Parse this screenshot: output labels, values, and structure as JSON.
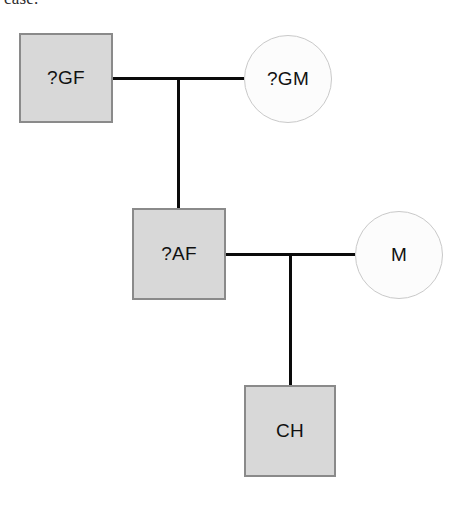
{
  "page": {
    "width": 467,
    "height": 506,
    "background": "#ffffff",
    "clipped_caption": "case."
  },
  "colors": {
    "male_fill": "#d8d8d8",
    "male_stroke": "#8a8a8a",
    "female_fill": "#fcfcfc",
    "female_stroke": "#c9c9c9",
    "line": "#0a0a0a",
    "text": "#111111"
  },
  "diagram": {
    "type": "pedigree-chart",
    "title": "",
    "generations": 3,
    "nodes": [
      {
        "id": "GF",
        "label": "?GF",
        "shape": "square",
        "sex": "male",
        "affected": "unknown",
        "generation": 1,
        "x": 19,
        "y": 33,
        "w": 94,
        "h": 90
      },
      {
        "id": "GM",
        "label": "?GM",
        "shape": "circle",
        "sex": "female",
        "affected": "unknown",
        "generation": 1,
        "x": 244,
        "y": 35,
        "w": 88,
        "h": 88
      },
      {
        "id": "AF",
        "label": "?AF",
        "shape": "square",
        "sex": "male",
        "affected": "unknown",
        "generation": 2,
        "x": 132,
        "y": 208,
        "w": 94,
        "h": 92
      },
      {
        "id": "M",
        "label": "M",
        "shape": "circle",
        "sex": "female",
        "affected": "unaffected",
        "generation": 2,
        "x": 355,
        "y": 211,
        "w": 88,
        "h": 88
      },
      {
        "id": "CH",
        "label": "CH",
        "shape": "square",
        "sex": "male",
        "affected": "unaffected",
        "generation": 3,
        "x": 244,
        "y": 385,
        "w": 92,
        "h": 92
      }
    ],
    "edges": [
      {
        "id": "union-1",
        "kind": "mating-line",
        "from": "GF",
        "to": "GM",
        "x": 113,
        "y": 77,
        "length": 131,
        "orientation": "horizontal"
      },
      {
        "id": "descent-1",
        "kind": "descent-line",
        "from": "union-1",
        "to": "AF",
        "x": 177,
        "y": 77,
        "length": 131,
        "orientation": "vertical"
      },
      {
        "id": "union-2",
        "kind": "mating-line",
        "from": "AF",
        "to": "M",
        "x": 226,
        "y": 253,
        "length": 129,
        "orientation": "horizontal"
      },
      {
        "id": "descent-2",
        "kind": "descent-line",
        "from": "union-2",
        "to": "CH",
        "x": 289,
        "y": 253,
        "length": 132,
        "orientation": "vertical"
      }
    ]
  }
}
